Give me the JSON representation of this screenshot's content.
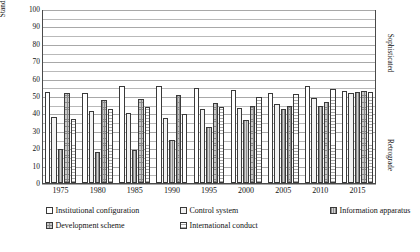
{
  "chart_data": {
    "type": "bar",
    "title": "",
    "xlabel": "",
    "ylabel": "Standardized score",
    "ylim": [
      0,
      100
    ],
    "ytick_values": [
      0,
      10,
      20,
      30,
      40,
      50,
      60,
      70,
      80,
      90,
      100
    ],
    "ytick_labels": [
      "0",
      "10",
      "20",
      "30",
      "40",
      "50",
      "60",
      "70",
      "80",
      "90",
      "100"
    ],
    "grid": true,
    "grid_interval": 5,
    "legend_position": "below",
    "categories": [
      "1975",
      "1980",
      "1985",
      "1990",
      "1995",
      "2000",
      "2005",
      "2010",
      "2015"
    ],
    "series": [
      {
        "name": "Institutional configuration",
        "values": [
          52.5,
          51.5,
          56.0,
          56.0,
          54.5,
          53.5,
          52.0,
          55.5,
          53.0
        ]
      },
      {
        "name": "Control system",
        "values": [
          38.0,
          41.5,
          40.0,
          37.5,
          42.5,
          43.0,
          45.5,
          49.0,
          51.5
        ]
      },
      {
        "name": "Information apparatus",
        "values": [
          19.5,
          18.0,
          19.0,
          24.5,
          32.0,
          36.0,
          42.5,
          44.5,
          52.5
        ]
      },
      {
        "name": "Development scheme",
        "values": [
          52.0,
          47.5,
          48.5,
          50.5,
          46.0,
          44.5,
          44.0,
          46.5,
          53.0
        ]
      },
      {
        "name": "International conduct",
        "values": [
          37.0,
          42.5,
          43.5,
          39.5,
          43.5,
          49.5,
          51.0,
          54.0,
          52.5
        ]
      }
    ],
    "annotations": [
      {
        "text": "Sophisticated",
        "position": "right-upper"
      },
      {
        "text": "Retrograde",
        "position": "right-lower"
      }
    ]
  },
  "axis": {
    "y_title": "Standardized score"
  },
  "side_notes": {
    "sophisticated": "Sophisticated",
    "retrograde": "Retrograde"
  },
  "legend": {
    "items": [
      {
        "label": "Institutional configuration"
      },
      {
        "label": "Control system"
      },
      {
        "label": "Information apparatus"
      },
      {
        "label": "Development scheme"
      },
      {
        "label": "International conduct"
      }
    ]
  }
}
